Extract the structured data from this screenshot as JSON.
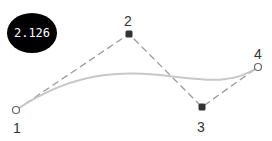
{
  "diagram": {
    "type": "cubic-bezier",
    "badge": {
      "value": "2.126",
      "cx": 32,
      "cy": 33,
      "rx": 25,
      "ry": 20,
      "color": "#000000",
      "text_color": "#ffffff"
    },
    "control_points": [
      {
        "label": "1",
        "x": 16,
        "y": 110,
        "style": "hollow",
        "label_x": 13,
        "label_y": 133
      },
      {
        "label": "2",
        "x": 129,
        "y": 34,
        "style": "filled",
        "label_x": 124,
        "label_y": 26
      },
      {
        "label": "3",
        "x": 202,
        "y": 107,
        "style": "filled",
        "label_x": 197,
        "label_y": 132
      },
      {
        "label": "4",
        "x": 258,
        "y": 67,
        "style": "hollow",
        "label_x": 254,
        "label_y": 59
      }
    ],
    "colors": {
      "curve": "#c8c8c8",
      "control_polygon": "#9a9a9a",
      "filled_point": "#333333",
      "hollow_point_stroke": "#666666",
      "label": "#333333"
    }
  }
}
